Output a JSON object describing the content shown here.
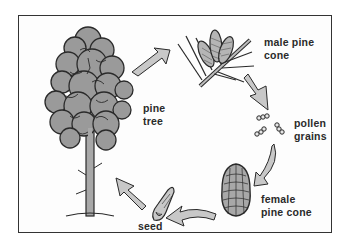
{
  "diagram": {
    "stages": [
      {
        "id": "pine-tree",
        "label_line1": "pine",
        "label_line2": "tree"
      },
      {
        "id": "male-pine-cone",
        "label_line1": "male pine",
        "label_line2": "cone"
      },
      {
        "id": "pollen-grains",
        "label_line1": "pollen",
        "label_line2": "grains"
      },
      {
        "id": "female-pine-cone",
        "label_line1": "female",
        "label_line2": "pine cone"
      },
      {
        "id": "seed",
        "label_line1": "seed",
        "label_line2": ""
      }
    ],
    "arrows": [
      {
        "from": "pine-tree",
        "to": "male-pine-cone"
      },
      {
        "from": "male-pine-cone",
        "to": "pollen-grains"
      },
      {
        "from": "pollen-grains",
        "to": "female-pine-cone"
      },
      {
        "from": "female-pine-cone",
        "to": "seed"
      },
      {
        "from": "seed",
        "to": "pine-tree"
      }
    ],
    "colors": {
      "foliage": "#9a9a9a",
      "outline": "#2a2a2a",
      "arrow_fill": "#c8c8c8",
      "frame": "#333333",
      "background": "#fdfdfd"
    }
  }
}
